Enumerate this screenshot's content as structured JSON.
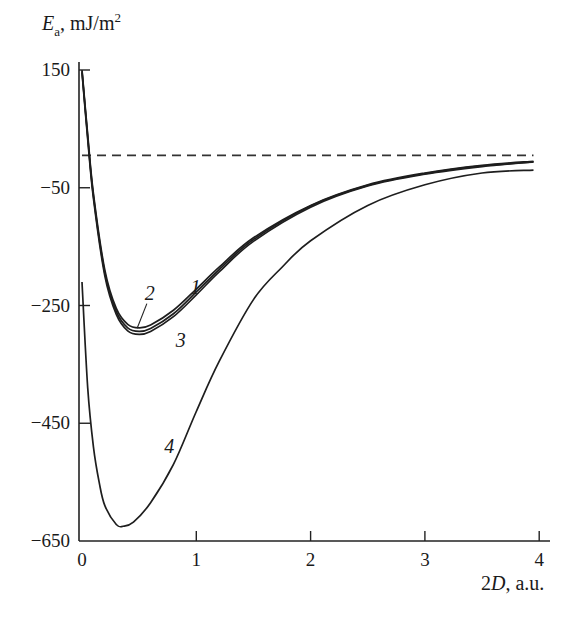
{
  "chart_data": {
    "type": "line",
    "title": "",
    "xlabel": "2D, a.u.",
    "ylabel": "E_a, mJ/m²",
    "ylabel_parts": {
      "symbol": "E",
      "subscript": "a",
      "unit": ", mJ/m",
      "sup": "2"
    },
    "xlabel_parts": {
      "num": "2",
      "var": "D",
      "unit": ", a.u."
    },
    "xlim": [
      0,
      4
    ],
    "ylim": [
      -650,
      150
    ],
    "xticks": [
      0,
      1,
      2,
      3,
      4
    ],
    "xtick_labels": [
      "0",
      "1",
      "2",
      "3",
      "4"
    ],
    "yticks": [
      150,
      -50,
      -250,
      -450,
      -650
    ],
    "ytick_labels": [
      "150",
      "−50",
      "−250",
      "−450",
      "−650"
    ],
    "grid": false,
    "legend": "none (curves labeled inline 1, 2, 3, 4)",
    "reference_line": {
      "y": 0,
      "style": "dashed",
      "x_range": [
        0,
        3.95
      ]
    },
    "series": [
      {
        "name": "1",
        "label_pos": [
          0.95,
          -230
        ],
        "x": [
          0.0,
          0.05,
          0.1,
          0.2,
          0.3,
          0.4,
          0.5,
          0.6,
          0.8,
          1.0,
          1.2,
          1.5,
          2.0,
          2.5,
          3.0,
          3.5,
          3.95
        ],
        "y": [
          150,
          40,
          -60,
          -190,
          -255,
          -282,
          -288,
          -283,
          -258,
          -222,
          -185,
          -135,
          -80,
          -45,
          -25,
          -12,
          -5
        ]
      },
      {
        "name": "2",
        "label_pos": [
          0.55,
          -240
        ],
        "x": [
          0.0,
          0.05,
          0.1,
          0.2,
          0.3,
          0.4,
          0.5,
          0.6,
          0.8,
          1.0,
          1.2,
          1.5,
          2.0,
          2.5,
          3.0,
          3.5,
          3.95
        ],
        "y": [
          148,
          36,
          -64,
          -195,
          -260,
          -288,
          -294,
          -289,
          -264,
          -227,
          -189,
          -138,
          -81,
          -46,
          -26,
          -13,
          -6
        ]
      },
      {
        "name": "3",
        "label_pos": [
          0.82,
          -320
        ],
        "x": [
          0.0,
          0.05,
          0.1,
          0.2,
          0.3,
          0.4,
          0.5,
          0.6,
          0.8,
          1.0,
          1.2,
          1.5,
          2.0,
          2.5,
          3.0,
          3.5,
          3.95
        ],
        "y": [
          146,
          32,
          -68,
          -200,
          -265,
          -293,
          -299,
          -294,
          -269,
          -232,
          -193,
          -141,
          -83,
          -47,
          -27,
          -14,
          -6
        ]
      },
      {
        "name": "4",
        "label_pos": [
          0.72,
          -500
        ],
        "x": [
          0.0,
          0.05,
          0.1,
          0.15,
          0.2,
          0.3,
          0.36,
          0.45,
          0.6,
          0.8,
          1.0,
          1.2,
          1.5,
          1.75,
          2.0,
          2.5,
          3.0,
          3.5,
          3.95
        ],
        "y": [
          -210,
          -390,
          -490,
          -550,
          -590,
          -622,
          -625,
          -618,
          -585,
          -520,
          -430,
          -345,
          -240,
          -185,
          -140,
          -80,
          -45,
          -25,
          -20
        ]
      }
    ]
  }
}
